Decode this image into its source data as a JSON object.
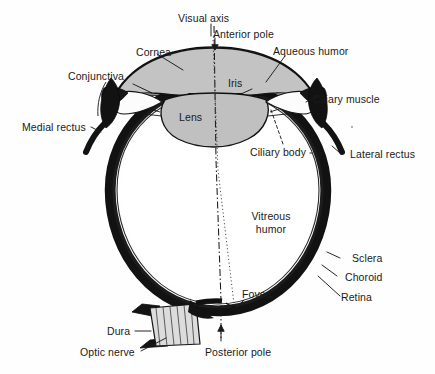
{
  "figure": {
    "background_color": "#fefefe",
    "ink_color": "#1a1a1a",
    "fill_colors": {
      "aqueous_humor": "#c3c3c3",
      "lens": "#c0c0c0",
      "sclera_coat": "#141414",
      "vitreous_humor": "#ffffff",
      "optic_nerve_hatch": "#d8d8d8"
    }
  },
  "labels": {
    "visual_axis": "Visual axis",
    "anterior_pole": "Anterior pole",
    "cornea": "Cornea",
    "aqueous_humor": "Aqueous humor",
    "conjunctiva": "Conjunctiva",
    "iris": "Iris",
    "ciliary_muscle": "Ciliary muscle",
    "lens": "Lens",
    "medial_rectus": "Medial rectus",
    "ciliary_body": "Ciliary body",
    "lateral_rectus": "Lateral rectus",
    "vitreous_humor_line1": "Vitreous",
    "vitreous_humor_line2": "humor",
    "sclera": "Sclera",
    "choroid": "Choroid",
    "retina": "Retina",
    "fovea": "Fovea",
    "dura": "Dura",
    "optic_nerve": "Optic nerve",
    "posterior_pole": "Posterior pole"
  },
  "structures": [
    {
      "name": "visual-axis",
      "kind": "axis-line",
      "style": "dash-dot"
    },
    {
      "name": "optic-axis",
      "kind": "axis-line",
      "style": "dotted"
    },
    {
      "name": "cornea",
      "kind": "outline"
    },
    {
      "name": "anterior-chamber",
      "kind": "filled-region"
    },
    {
      "name": "iris",
      "kind": "outline"
    },
    {
      "name": "lens",
      "kind": "filled-region"
    },
    {
      "name": "ciliary-body",
      "kind": "outline"
    },
    {
      "name": "sclera",
      "kind": "thick-arc"
    },
    {
      "name": "choroid",
      "kind": "thick-arc"
    },
    {
      "name": "retina",
      "kind": "thick-arc"
    },
    {
      "name": "vitreous-body",
      "kind": "filled-region"
    },
    {
      "name": "optic-nerve",
      "kind": "hatched-region"
    },
    {
      "name": "dura-sheath",
      "kind": "outline"
    },
    {
      "name": "medial-rectus-muscle",
      "kind": "thick-stroke"
    },
    {
      "name": "lateral-rectus-muscle",
      "kind": "thick-stroke"
    },
    {
      "name": "fovea",
      "kind": "marker"
    },
    {
      "name": "posterior-pole",
      "kind": "marker"
    },
    {
      "name": "anterior-pole",
      "kind": "marker"
    }
  ]
}
